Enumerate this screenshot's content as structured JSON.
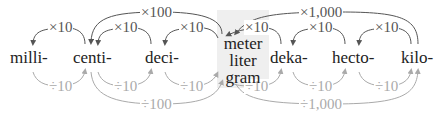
{
  "diagram": {
    "units": {
      "milli": "milli-",
      "centi": "centi-",
      "deci": "deci-",
      "deka": "deka-",
      "hecto": "hecto-",
      "kilo": "kilo-"
    },
    "base_units": [
      "meter",
      "liter",
      "gram"
    ],
    "multiply_labels": {
      "milli_from_centi": "×10",
      "centi_from_deci": "×10",
      "deci_from_base": "×10",
      "base_from_deka": "×10",
      "deka_from_hecto": "×10",
      "hecto_from_kilo": "×10",
      "centi_from_base": "×100",
      "base_from_kilo": "×1,000"
    },
    "divide_labels": {
      "milli_to_centi": "÷10",
      "centi_to_deci": "÷10",
      "deci_to_base": "÷10",
      "base_to_deka": "÷10",
      "deka_to_hecto": "÷10",
      "hecto_to_kilo": "÷10",
      "centi_to_base": "÷100",
      "base_to_kilo": "÷1,000"
    },
    "colors": {
      "multiply_arrow": "#555555",
      "divide_arrow": "#aaaaaa",
      "base_highlight": "#efefef",
      "text": "#222222"
    }
  }
}
